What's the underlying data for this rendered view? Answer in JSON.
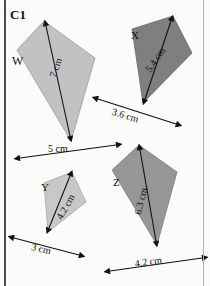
{
  "panel": {
    "code": "C1",
    "background_color": "#fbfbfa",
    "frame_left_color": "#4a4a4a",
    "frame_right_color": "#b0b0b0"
  },
  "shapes": [
    {
      "id": "kite-w",
      "label": "W",
      "fill": "#c2c2c2",
      "stroke": "#9a9a9a",
      "points": "44,21 95,58 71,141 17,50",
      "diagonal_label": "7 cm",
      "diagonal_arrow": {
        "x1": 46,
        "y1": 26,
        "x2": 70,
        "y2": 136
      },
      "base_label": "5 cm",
      "base_arrow": {
        "x1": 20,
        "y1": 158,
        "x2": 116,
        "y2": 145
      }
    },
    {
      "id": "kite-x",
      "label": "X",
      "fill": "#7f7f7f",
      "stroke": "#6a6a6a",
      "points": "173,16 192,53 143,103 132,29",
      "diagonal_label": "5.4 cm",
      "diagonal_arrow": {
        "x1": 171,
        "y1": 21,
        "x2": 145,
        "y2": 99
      },
      "base_label": "3.6 cm",
      "base_arrow": {
        "x1": 98,
        "y1": 99,
        "x2": 176,
        "y2": 124
      }
    },
    {
      "id": "kite-y",
      "label": "Y",
      "fill": "#c8c8c8",
      "stroke": "#a5a5a5",
      "points": "72,172 86,202 48,232 44,183",
      "diagonal_label": "4.2 cm",
      "diagonal_arrow": {
        "x1": 70,
        "y1": 176,
        "x2": 49,
        "y2": 228
      },
      "base_label": "3 cm",
      "base_arrow": {
        "x1": 14,
        "y1": 238,
        "x2": 79,
        "y2": 255
      }
    },
    {
      "id": "kite-z",
      "label": "Z",
      "fill": "#969696",
      "stroke": "#7d7d7d",
      "points": "139,145 177,172 157,245 112,170",
      "diagonal_label": "6.3 cm",
      "diagonal_arrow": {
        "x1": 140,
        "y1": 150,
        "x2": 156,
        "y2": 241
      },
      "base_label": "4.2 cm",
      "base_arrow": {
        "x1": 110,
        "y1": 271,
        "x2": 202,
        "y2": 258
      }
    }
  ],
  "arrow_color": "#111111"
}
